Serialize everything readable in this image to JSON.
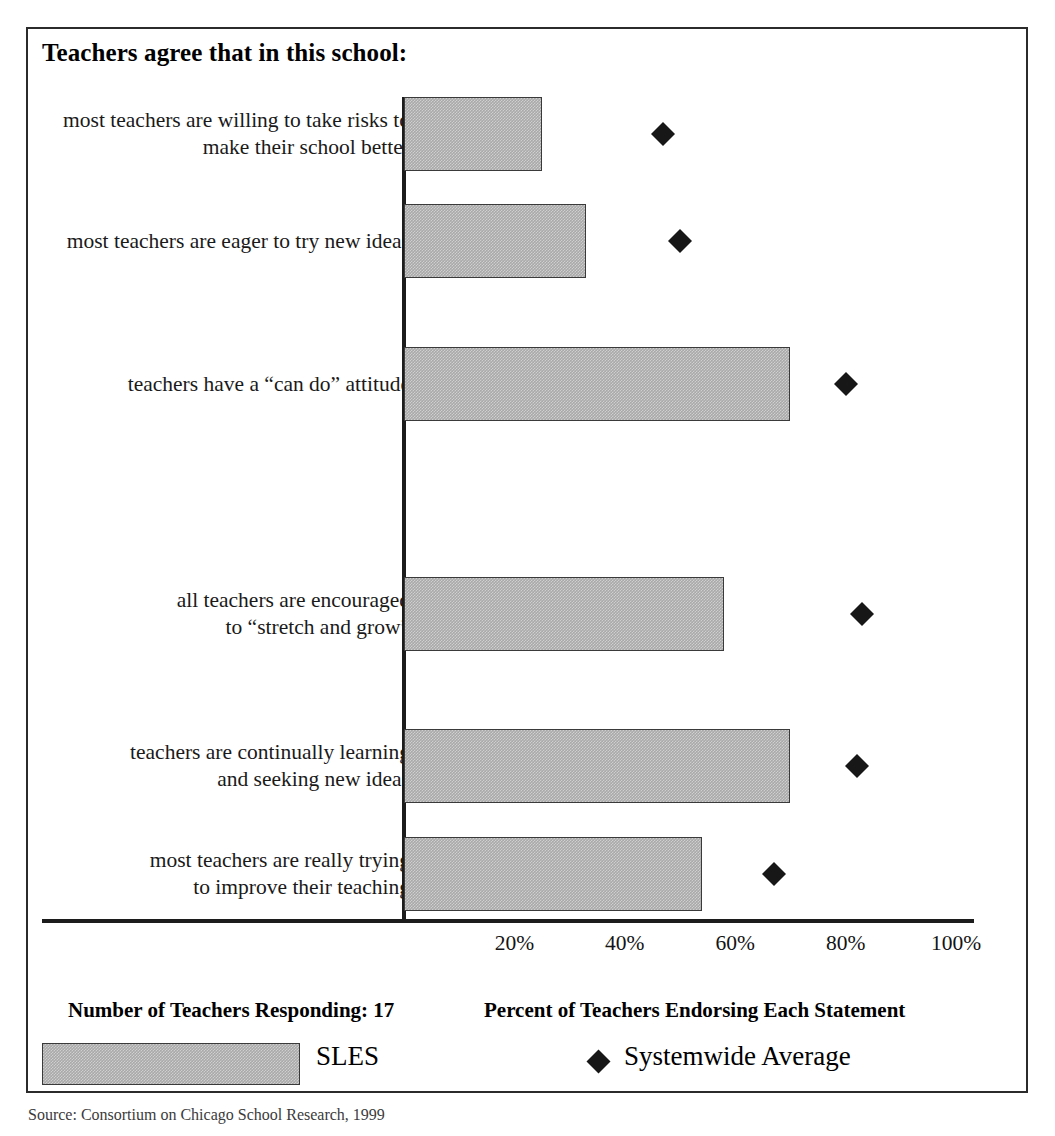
{
  "chart": {
    "title": "Teachers agree that in this school:",
    "respondents_caption": "Number of Teachers Responding: 17",
    "axis_caption": "Percent of Teachers Endorsing Each Statement",
    "source_note": "Source: Consortium on Chicago School Research, 1999"
  },
  "legend": {
    "bar_label": "SLES",
    "marker_label": "Systemwide Average",
    "marker_icon": "diamond-icon",
    "bar_swatch_icon": "hatched-bar-swatch"
  },
  "chart_data": {
    "type": "bar",
    "orientation": "horizontal",
    "title": "Teachers agree that in this school:",
    "xlabel": "Percent of Teachers Endorsing Each Statement",
    "ylabel": "",
    "xlim": [
      0,
      104
    ],
    "grid": false,
    "legend_position": "bottom",
    "tick_labels": [
      "20%",
      "40%",
      "60%",
      "80%",
      "100%"
    ],
    "ticks": [
      20,
      40,
      60,
      80,
      100
    ],
    "categories": [
      "most teachers are willing to take risks to make their school better",
      "most teachers are eager to try new ideas",
      "teachers have a “can do” attitude",
      "all teachers are encouraged to “stretch and grow”",
      "teachers are continually learning and seeking new ideas",
      "most teachers are really trying to improve their teaching"
    ],
    "category_lines": [
      [
        "most teachers are willing to take risks to",
        "make their school better"
      ],
      [
        "most teachers are eager to try new ideas"
      ],
      [
        "teachers have a “can do” attitude"
      ],
      [
        "all teachers are encouraged",
        "to “stretch and grow”"
      ],
      [
        "teachers are continually learning",
        "and seeking new ideas"
      ],
      [
        "most teachers are really trying",
        "to improve their teaching"
      ]
    ],
    "series": [
      {
        "name": "SLES",
        "type": "bar",
        "color": "#a9a9a9",
        "values": [
          25,
          33,
          70,
          58,
          70,
          54
        ]
      },
      {
        "name": "Systemwide Average",
        "type": "marker",
        "marker": "diamond",
        "color": "#171717",
        "values": [
          47,
          50,
          80,
          83,
          82,
          67
        ]
      }
    ]
  },
  "geometry": {
    "axis_x": 376,
    "px_per_percent": 5.52,
    "bar_tops": [
      68,
      175,
      318,
      548,
      700,
      808
    ],
    "label_centers": [
      105,
      212,
      355,
      585,
      737,
      845
    ],
    "bar_height": 74
  }
}
